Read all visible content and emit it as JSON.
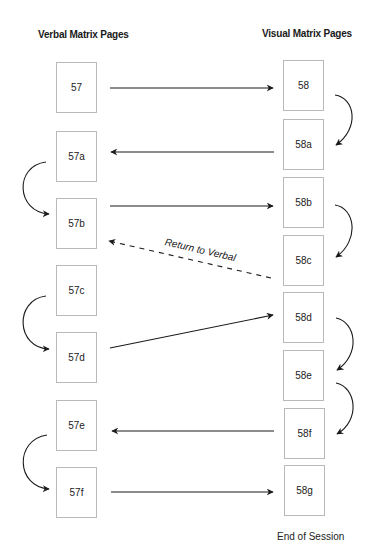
{
  "headings": {
    "verbal": "Verbal Matrix Pages",
    "visual": "Visual Matrix Pages"
  },
  "verbal_pages": [
    {
      "id": "57",
      "label": "57"
    },
    {
      "id": "57a",
      "label": "57a"
    },
    {
      "id": "57b",
      "label": "57b"
    },
    {
      "id": "57c",
      "label": "57c"
    },
    {
      "id": "57d",
      "label": "57d"
    },
    {
      "id": "57e",
      "label": "57e"
    },
    {
      "id": "57f",
      "label": "57f"
    }
  ],
  "visual_pages": [
    {
      "id": "58",
      "label": "58"
    },
    {
      "id": "58a",
      "label": "58a"
    },
    {
      "id": "58b",
      "label": "58b"
    },
    {
      "id": "58c",
      "label": "58c"
    },
    {
      "id": "58d",
      "label": "58d"
    },
    {
      "id": "58e",
      "label": "58e"
    },
    {
      "id": "58f",
      "label": "58f"
    },
    {
      "id": "58g",
      "label": "58g"
    }
  ],
  "edges": [
    {
      "from": "57",
      "to": "58",
      "style": "solid"
    },
    {
      "from": "58",
      "to": "58a",
      "style": "curved"
    },
    {
      "from": "58a",
      "to": "57a",
      "style": "solid"
    },
    {
      "from": "57a",
      "to": "57b",
      "style": "curved"
    },
    {
      "from": "57b",
      "to": "58b",
      "style": "solid"
    },
    {
      "from": "58b",
      "to": "58c",
      "style": "curved"
    },
    {
      "from": "58c",
      "to": "57b",
      "style": "dashed",
      "label": "Return to Verbal"
    },
    {
      "from": "57c",
      "to": "57d",
      "style": "curved"
    },
    {
      "from": "57d",
      "to": "58d",
      "style": "solid"
    },
    {
      "from": "58d",
      "to": "58e",
      "style": "curved"
    },
    {
      "from": "58e",
      "to": "58f",
      "style": "curved"
    },
    {
      "from": "58f",
      "to": "57e",
      "style": "solid"
    },
    {
      "from": "57e",
      "to": "57f",
      "style": "curved"
    },
    {
      "from": "57f",
      "to": "58g",
      "style": "solid"
    }
  ],
  "labels": {
    "return_to_verbal": "Return to Verbal",
    "end_of_session": "End of Session"
  },
  "colors": {
    "line": "#1a1a1a",
    "box_border": "#b9b9b9"
  }
}
